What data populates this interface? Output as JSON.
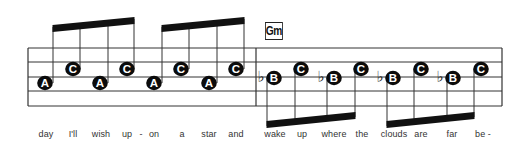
{
  "chord": {
    "label": "Gm"
  },
  "staff": {
    "lines_y": [
      48,
      62,
      77,
      91,
      106
    ],
    "left_x": 28,
    "right_x": 502,
    "barlines_x": [
      28,
      256,
      502
    ],
    "color": "#333333"
  },
  "groups": [
    {
      "direction": "up",
      "beam": {
        "x1": 53,
        "y1_top": 25,
        "x2": 134,
        "y2_top": 17,
        "thickness": 7
      },
      "notes": [
        {
          "letter": "A",
          "x": 45,
          "y": 83,
          "stem_x": 53,
          "flat": false
        },
        {
          "letter": "C",
          "x": 73,
          "y": 69,
          "stem_x": 80,
          "flat": false
        },
        {
          "letter": "A",
          "x": 100,
          "y": 83,
          "stem_x": 108,
          "flat": false
        },
        {
          "letter": "C",
          "x": 127,
          "y": 69,
          "stem_x": 134,
          "flat": false
        }
      ]
    },
    {
      "direction": "up",
      "beam": {
        "x1": 162,
        "y1_top": 25,
        "x2": 244,
        "y2_top": 17,
        "thickness": 7
      },
      "notes": [
        {
          "letter": "A",
          "x": 154,
          "y": 83,
          "stem_x": 162,
          "flat": false
        },
        {
          "letter": "C",
          "x": 181,
          "y": 69,
          "stem_x": 189,
          "flat": false
        },
        {
          "letter": "A",
          "x": 209,
          "y": 83,
          "stem_x": 217,
          "flat": false
        },
        {
          "letter": "C",
          "x": 236,
          "y": 69,
          "stem_x": 244,
          "flat": false
        }
      ]
    },
    {
      "direction": "down",
      "beam": {
        "x1": 267,
        "y1_bot": 128,
        "x2": 355,
        "y2_bot": 119,
        "thickness": 7
      },
      "notes": [
        {
          "letter": "B",
          "x": 274,
          "y": 78,
          "stem_x": 267,
          "flat": true
        },
        {
          "letter": "C",
          "x": 301,
          "y": 69,
          "stem_x": 295,
          "flat": false
        },
        {
          "letter": "B",
          "x": 334,
          "y": 78,
          "stem_x": 327,
          "flat": true
        },
        {
          "letter": "C",
          "x": 361,
          "y": 69,
          "stem_x": 355,
          "flat": false
        }
      ]
    },
    {
      "direction": "down",
      "beam": {
        "x1": 387,
        "y1_bot": 128,
        "x2": 474,
        "y2_bot": 119,
        "thickness": 7
      },
      "notes": [
        {
          "letter": "B",
          "x": 393,
          "y": 78,
          "stem_x": 387,
          "flat": true
        },
        {
          "letter": "C",
          "x": 421,
          "y": 69,
          "stem_x": 414,
          "flat": false
        },
        {
          "letter": "B",
          "x": 453,
          "y": 78,
          "stem_x": 447,
          "flat": true
        },
        {
          "letter": "C",
          "x": 481,
          "y": 69,
          "stem_x": 474,
          "flat": false
        }
      ]
    }
  ],
  "lyrics": [
    {
      "text": "day",
      "x": 46
    },
    {
      "text": "I'll",
      "x": 73
    },
    {
      "text": "wish",
      "x": 101
    },
    {
      "text": "up",
      "x": 127
    },
    {
      "text": "-",
      "x": 141
    },
    {
      "text": "on",
      "x": 154
    },
    {
      "text": "a",
      "x": 182
    },
    {
      "text": "star",
      "x": 209
    },
    {
      "text": "and",
      "x": 236
    },
    {
      "text": "wake",
      "x": 275
    },
    {
      "text": "up",
      "x": 302
    },
    {
      "text": "where",
      "x": 334
    },
    {
      "text": "the",
      "x": 362
    },
    {
      "text": "clouds",
      "x": 394
    },
    {
      "text": "are",
      "x": 421
    },
    {
      "text": "far",
      "x": 452
    },
    {
      "text": "be -",
      "x": 483
    }
  ]
}
